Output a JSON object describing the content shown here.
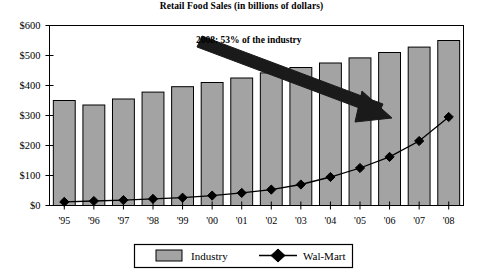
{
  "chart_data": {
    "type": "bar",
    "title": "Retail Food Sales (in billions of dollars)",
    "xlabel": "",
    "ylabel": "",
    "ylim": [
      0,
      600
    ],
    "ytick_step": 100,
    "grid": false,
    "legend_position": "bottom",
    "categories": [
      "'95",
      "'96",
      "'97",
      "'98",
      "'99",
      "'00",
      "'01",
      "'02",
      "'03",
      "'04",
      "'05",
      "'06",
      "'07",
      "'08"
    ],
    "ytick_labels": [
      "$0",
      "$100",
      "$200",
      "$300",
      "$400",
      "$500",
      "$600"
    ],
    "ytick_values": [
      0,
      100,
      200,
      300,
      400,
      500,
      600
    ],
    "series": [
      {
        "name": "Industry",
        "kind": "bar",
        "color": "#a3a3a3",
        "edge_color": "#000000",
        "values": [
          350,
          335,
          355,
          378,
          396,
          410,
          425,
          442,
          460,
          475,
          492,
          510,
          528,
          550
        ]
      },
      {
        "name": "Wal-Mart",
        "kind": "line",
        "color": "#000000",
        "marker": "diamond",
        "values": [
          12,
          15,
          18,
          22,
          26,
          33,
          42,
          53,
          70,
          95,
          125,
          162,
          215,
          295
        ]
      }
    ],
    "annotations": [
      {
        "name": "industry-share-callout",
        "text": "2008: 53% of the industry",
        "arrow": "down-right"
      }
    ]
  },
  "legend": {
    "items": [
      {
        "label": "Industry",
        "swatch": "bar-swatch"
      },
      {
        "label": "Wal-Mart",
        "swatch": "diamond-marker"
      }
    ]
  }
}
